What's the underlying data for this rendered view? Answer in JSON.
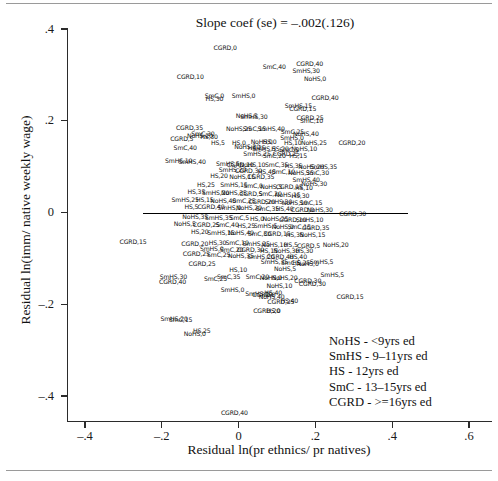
{
  "chart_data": {
    "type": "scatter",
    "title": "Slope coef (se) = –.002(.126)",
    "xlabel": "Residual ln(pr ethnics/ pr natives)",
    "ylabel": "Residual ln(imm/ native weekly wage)",
    "xlim": [
      -0.5,
      0.62
    ],
    "ylim": [
      -0.47,
      0.42
    ],
    "xticks": [
      "–.4",
      "–.2",
      "0",
      ".2",
      ".4",
      ".6"
    ],
    "xtick_values": [
      -0.4,
      -0.2,
      0,
      0.2,
      0.4,
      0.6
    ],
    "yticks": [
      ".4",
      ".2",
      "0",
      "–.2",
      "–.4"
    ],
    "ytick_values": [
      0.4,
      0.2,
      0,
      -0.2,
      -0.4
    ],
    "grid": false,
    "legend_position": "bottom-right",
    "marker_style": "text-label",
    "fit_line": {
      "slope": -0.002,
      "se": 0.126,
      "intercept": 0.0,
      "x_start": -0.25,
      "x_end": 0.44
    },
    "label_format": "educationgroup,agegroup",
    "points": [
      {
        "label": "CGRD,0",
        "x": -0.035,
        "y": 0.358
      },
      {
        "label": "SmC,40",
        "x": 0.093,
        "y": 0.318
      },
      {
        "label": "CGRD,40",
        "x": 0.185,
        "y": 0.324
      },
      {
        "label": "SmHS,30",
        "x": 0.176,
        "y": 0.308
      },
      {
        "label": "CGRD,10",
        "x": -0.126,
        "y": 0.296
      },
      {
        "label": "NoHS,0",
        "x": 0.199,
        "y": 0.291
      },
      {
        "label": "SmC,0",
        "x": -0.063,
        "y": 0.255
      },
      {
        "label": "HS,30",
        "x": -0.063,
        "y": 0.247
      },
      {
        "label": "SmHS,0",
        "x": 0.013,
        "y": 0.253
      },
      {
        "label": "CGRD,40",
        "x": 0.225,
        "y": 0.25
      },
      {
        "label": "SmHS,15",
        "x": 0.156,
        "y": 0.233
      },
      {
        "label": "CGRD,15",
        "x": 0.167,
        "y": 0.226
      },
      {
        "label": "NoHS,5",
        "x": 0.021,
        "y": 0.211
      },
      {
        "label": "SmHS,30",
        "x": 0.04,
        "y": 0.208
      },
      {
        "label": "CGRD,25",
        "x": 0.186,
        "y": 0.206
      },
      {
        "label": "SmC,10",
        "x": 0.19,
        "y": 0.199
      },
      {
        "label": "CGRD,35",
        "x": -0.128,
        "y": 0.184
      },
      {
        "label": "NoHS,25",
        "x": 0.001,
        "y": 0.182
      },
      {
        "label": "SmC,15",
        "x": 0.041,
        "y": 0.182
      },
      {
        "label": "SmHS,40",
        "x": 0.085,
        "y": 0.181
      },
      {
        "label": "SmC,25",
        "x": 0.14,
        "y": 0.176
      },
      {
        "label": "NoHS,40",
        "x": 0.175,
        "y": 0.172
      },
      {
        "label": "SmC,30",
        "x": -0.093,
        "y": 0.172
      },
      {
        "label": "NoHS,20",
        "x": -0.101,
        "y": 0.166
      },
      {
        "label": "HS,30",
        "x": -0.077,
        "y": 0.165
      },
      {
        "label": "SmHS,0",
        "x": 0.139,
        "y": 0.162
      },
      {
        "label": "CGRD,5",
        "x": -0.148,
        "y": 0.16
      },
      {
        "label": "HS,5",
        "x": -0.054,
        "y": 0.152
      },
      {
        "label": "HS,0",
        "x": 0.001,
        "y": 0.151
      },
      {
        "label": "NoHS,0",
        "x": 0.06,
        "y": 0.154
      },
      {
        "label": "HS,0",
        "x": 0.081,
        "y": 0.153
      },
      {
        "label": "HS,10",
        "x": 0.141,
        "y": 0.152
      },
      {
        "label": "NoHS,25",
        "x": 0.196,
        "y": 0.151
      },
      {
        "label": "CGRD,20",
        "x": 0.295,
        "y": 0.152
      },
      {
        "label": "SmC,40",
        "x": -0.139,
        "y": 0.141
      },
      {
        "label": "HS,25",
        "x": 0.047,
        "y": 0.141
      },
      {
        "label": "NoHS,30",
        "x": 0.022,
        "y": 0.143
      },
      {
        "label": "SmHS,5",
        "x": 0.066,
        "y": 0.139
      },
      {
        "label": "HS,20",
        "x": 0.108,
        "y": 0.138
      },
      {
        "label": "SmC,5",
        "x": 0.131,
        "y": 0.137
      },
      {
        "label": "NoHS,10",
        "x": 0.171,
        "y": 0.139
      },
      {
        "label": "CGRD,25",
        "x": 0.124,
        "y": 0.127
      },
      {
        "label": "SmHS,25",
        "x": 0.048,
        "y": 0.127
      },
      {
        "label": "SmC,20",
        "x": 0.093,
        "y": 0.124
      },
      {
        "label": "HS,15",
        "x": 0.155,
        "y": 0.124
      },
      {
        "label": "SmHS,10",
        "x": -0.156,
        "y": 0.112
      },
      {
        "label": "SmHS,40",
        "x": -0.121,
        "y": 0.111
      },
      {
        "label": "SmHS,5",
        "x": -0.028,
        "y": 0.106
      },
      {
        "label": "CGRD,10",
        "x": 0.004,
        "y": 0.104
      },
      {
        "label": "NoHS,10",
        "x": 0.036,
        "y": 0.104
      },
      {
        "label": "SmC,35",
        "x": 0.099,
        "y": 0.103
      },
      {
        "label": "HS,35",
        "x": 0.143,
        "y": 0.101
      },
      {
        "label": "NoHS,20",
        "x": 0.189,
        "y": 0.1
      },
      {
        "label": "SmHS,35",
        "x": 0.221,
        "y": 0.099
      },
      {
        "label": "SmHS,20",
        "x": -0.016,
        "y": 0.092
      },
      {
        "label": "CGRD,30",
        "x": 0.026,
        "y": 0.091
      },
      {
        "label": "HS,40",
        "x": 0.073,
        "y": 0.089
      },
      {
        "label": "SmC,10",
        "x": 0.117,
        "y": 0.088
      },
      {
        "label": "NoHS,35",
        "x": 0.162,
        "y": 0.087
      },
      {
        "label": "SmC,30",
        "x": 0.205,
        "y": 0.086
      },
      {
        "label": "HS,20",
        "x": -0.051,
        "y": 0.079
      },
      {
        "label": "NoHS,15",
        "x": 0.009,
        "y": 0.078
      },
      {
        "label": "CGRD,35",
        "x": 0.058,
        "y": 0.077
      },
      {
        "label": "SmHS,40",
        "x": 0.176,
        "y": 0.071
      },
      {
        "label": "NoHS,30",
        "x": 0.197,
        "y": 0.062
      },
      {
        "label": "HS,25",
        "x": -0.085,
        "y": 0.061
      },
      {
        "label": "SmHS,15",
        "x": -0.012,
        "y": 0.059
      },
      {
        "label": "SmC,0",
        "x": 0.038,
        "y": 0.057
      },
      {
        "label": "NoHS,5",
        "x": 0.085,
        "y": 0.056
      },
      {
        "label": "CGRD,15",
        "x": 0.132,
        "y": 0.055
      },
      {
        "label": "HS,10",
        "x": 0.17,
        "y": 0.053
      },
      {
        "label": "HS,35",
        "x": -0.11,
        "y": 0.045
      },
      {
        "label": "SmHS,20",
        "x": -0.06,
        "y": 0.043
      },
      {
        "label": "NoHS,35",
        "x": -0.012,
        "y": 0.042
      },
      {
        "label": "CGRD,5",
        "x": 0.032,
        "y": 0.041
      },
      {
        "label": "SmC,20",
        "x": 0.082,
        "y": 0.04
      },
      {
        "label": "NoHS,15",
        "x": 0.128,
        "y": 0.039
      },
      {
        "label": "HS,30",
        "x": 0.161,
        "y": 0.037
      },
      {
        "label": "SmHS,25",
        "x": -0.139,
        "y": 0.028
      },
      {
        "label": "HS,15",
        "x": -0.088,
        "y": 0.027
      },
      {
        "label": "NoHS,40",
        "x": -0.04,
        "y": 0.025
      },
      {
        "label": "SmC,25",
        "x": 0.014,
        "y": 0.024
      },
      {
        "label": "CGRD,20",
        "x": 0.06,
        "y": 0.023
      },
      {
        "label": "SmHS,30",
        "x": 0.104,
        "y": 0.022
      },
      {
        "label": "NoHS,10",
        "x": 0.146,
        "y": 0.021
      },
      {
        "label": "SmC,15",
        "x": 0.188,
        "y": 0.02
      },
      {
        "label": "HS,5",
        "x": -0.123,
        "y": 0.012
      },
      {
        "label": "CGRD,40",
        "x": -0.072,
        "y": 0.011
      },
      {
        "label": "SmHS,0",
        "x": -0.024,
        "y": 0.01
      },
      {
        "label": "NoHS,20",
        "x": 0.027,
        "y": 0.009
      },
      {
        "label": "SmC,35",
        "x": 0.075,
        "y": 0.008
      },
      {
        "label": "HS,40",
        "x": 0.12,
        "y": 0.007
      },
      {
        "label": "CGRD,0",
        "x": 0.166,
        "y": 0.006
      },
      {
        "label": "NoHS,30",
        "x": 0.212,
        "y": 0.005
      },
      {
        "label": "CGRD,30",
        "x": 0.297,
        "y": -0.004
      },
      {
        "label": "NoHS,35",
        "x": -0.113,
        "y": -0.01
      },
      {
        "label": "SmHS,35",
        "x": -0.052,
        "y": -0.012
      },
      {
        "label": "SmC,5",
        "x": 0.002,
        "y": -0.013
      },
      {
        "label": "HS,0",
        "x": 0.048,
        "y": -0.014
      },
      {
        "label": "NoHS,25",
        "x": 0.096,
        "y": -0.015
      },
      {
        "label": "CGRD,10",
        "x": 0.141,
        "y": -0.016
      },
      {
        "label": "SmHS,10",
        "x": 0.185,
        "y": -0.017
      },
      {
        "label": "NoHS,5",
        "x": -0.14,
        "y": -0.026
      },
      {
        "label": "CGRD,25",
        "x": -0.084,
        "y": -0.027
      },
      {
        "label": "SmC,40",
        "x": -0.03,
        "y": -0.028
      },
      {
        "label": "HS,25",
        "x": 0.02,
        "y": -0.029
      },
      {
        "label": "SmHS,5",
        "x": 0.07,
        "y": -0.03
      },
      {
        "label": "NoHS,0",
        "x": 0.115,
        "y": -0.031
      },
      {
        "label": "SmC,15",
        "x": 0.158,
        "y": -0.032
      },
      {
        "label": "CGRD,35",
        "x": 0.201,
        "y": -0.033
      },
      {
        "label": "HS,20",
        "x": -0.101,
        "y": -0.042
      },
      {
        "label": "SmHS,15",
        "x": -0.046,
        "y": -0.044
      },
      {
        "label": "NoHS,40",
        "x": 0.006,
        "y": -0.045
      },
      {
        "label": "SmC,30",
        "x": 0.054,
        "y": -0.046
      },
      {
        "label": "CGRD,15",
        "x": 0.1,
        "y": -0.047
      },
      {
        "label": "HS,35",
        "x": 0.146,
        "y": -0.048
      },
      {
        "label": "NoHS,15",
        "x": 0.192,
        "y": -0.049
      },
      {
        "label": "CGRD,15",
        "x": -0.275,
        "y": -0.065
      },
      {
        "label": "CGRD,20",
        "x": -0.114,
        "y": -0.068
      },
      {
        "label": "HS,30",
        "x": -0.055,
        "y": -0.066
      },
      {
        "label": "SmC,10",
        "x": -0.004,
        "y": -0.067
      },
      {
        "label": "SmHS,25",
        "x": 0.046,
        "y": -0.069
      },
      {
        "label": "NoHS,10",
        "x": 0.093,
        "y": -0.07
      },
      {
        "label": "HS,5",
        "x": 0.136,
        "y": -0.071
      },
      {
        "label": "CGRD,5",
        "x": 0.182,
        "y": -0.072
      },
      {
        "label": "NoHS,20",
        "x": 0.253,
        "y": -0.071
      },
      {
        "label": "SmHS,0",
        "x": -0.07,
        "y": -0.079
      },
      {
        "label": "SmC,20",
        "x": -0.018,
        "y": -0.081
      },
      {
        "label": "CGRD,30",
        "x": 0.031,
        "y": -0.082
      },
      {
        "label": "HS,15",
        "x": 0.079,
        "y": -0.083
      },
      {
        "label": "NoHS,30",
        "x": 0.124,
        "y": -0.084
      },
      {
        "label": "HS,30",
        "x": 0.171,
        "y": -0.083
      },
      {
        "label": "CGRD,25",
        "x": -0.11,
        "y": -0.09
      },
      {
        "label": "SmC,25",
        "x": -0.052,
        "y": -0.093
      },
      {
        "label": "NoHS,35",
        "x": 0.006,
        "y": -0.095
      },
      {
        "label": "SmHS,20",
        "x": 0.058,
        "y": -0.096
      },
      {
        "label": "CGRD,40",
        "x": 0.108,
        "y": -0.097
      },
      {
        "label": "HS,40",
        "x": 0.155,
        "y": -0.098
      },
      {
        "label": "SmHS,35",
        "x": 0.093,
        "y": -0.108
      },
      {
        "label": "SmC,5",
        "x": 0.136,
        "y": -0.11
      },
      {
        "label": "HS,25",
        "x": 0.163,
        "y": -0.111
      },
      {
        "label": "SmHS,5",
        "x": 0.216,
        "y": -0.107
      },
      {
        "label": "NoHS,0",
        "x": 0.18,
        "y": -0.113
      },
      {
        "label": "CGRD,25",
        "x": -0.095,
        "y": -0.112
      },
      {
        "label": "HS,10",
        "x": -0.001,
        "y": -0.126
      },
      {
        "label": "NoHS,5",
        "x": 0.121,
        "y": -0.124
      },
      {
        "label": "SmHS,30",
        "x": -0.17,
        "y": -0.141
      },
      {
        "label": "SmC,35",
        "x": -0.026,
        "y": -0.14
      },
      {
        "label": "SmC,25",
        "x": -0.06,
        "y": -0.146
      },
      {
        "label": "SmC,20",
        "x": 0.049,
        "y": -0.14
      },
      {
        "label": "NoHS,0",
        "x": 0.084,
        "y": -0.142
      },
      {
        "label": "NoHS,20",
        "x": 0.12,
        "y": -0.143
      },
      {
        "label": "CGRD,40",
        "x": -0.172,
        "y": -0.151
      },
      {
        "label": "CGRD,30",
        "x": 0.18,
        "y": -0.15
      },
      {
        "label": "SmHS,5",
        "x": 0.244,
        "y": -0.137
      },
      {
        "label": "CGRD,30",
        "x": 0.192,
        "y": -0.156
      },
      {
        "label": "NoHS,10",
        "x": 0.106,
        "y": -0.16
      },
      {
        "label": "SmHS,0",
        "x": -0.016,
        "y": -0.168
      },
      {
        "label": "SmHS,10",
        "x": 0.053,
        "y": -0.177
      },
      {
        "label": "HS,40",
        "x": 0.09,
        "y": -0.176
      },
      {
        "label": "CGRD,0",
        "x": 0.066,
        "y": -0.179
      },
      {
        "label": "NoHS,40",
        "x": 0.086,
        "y": -0.185
      },
      {
        "label": "CGRD,25",
        "x": 0.11,
        "y": -0.196
      },
      {
        "label": "HS,40",
        "x": 0.132,
        "y": -0.194
      },
      {
        "label": "CGRD,20",
        "x": 0.073,
        "y": -0.215
      },
      {
        "label": "HS,0",
        "x": 0.091,
        "y": -0.214
      },
      {
        "label": "SmHS,20",
        "x": -0.168,
        "y": -0.233
      },
      {
        "label": "SmC,15",
        "x": -0.151,
        "y": -0.235
      },
      {
        "label": "CGRD,15",
        "x": 0.29,
        "y": -0.185
      },
      {
        "label": "HS,25",
        "x": -0.096,
        "y": -0.259
      },
      {
        "label": "NoHS,0",
        "x": -0.114,
        "y": -0.265
      },
      {
        "label": "CGRD,40",
        "x": -0.011,
        "y": -0.437
      }
    ],
    "legend_entries": [
      "NoHS - <9yrs ed",
      "SmHS - 9–11yrs ed",
      "HS - 12yrs ed",
      "SmC - 13–15yrs ed",
      "CGRD - >=16yrs ed"
    ]
  }
}
